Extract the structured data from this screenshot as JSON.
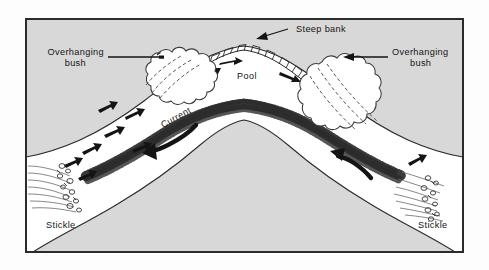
{
  "figure": {
    "frame": {
      "border_color": "#2b2b2b",
      "interior_color": "#d8d8d8",
      "page_color": "#fdfdfd"
    },
    "colors": {
      "land": "#d8d8d8",
      "water": "#ffffff",
      "ink": "#141414",
      "gravel": "#2a2a2a",
      "bush_line": "#3a3a3a"
    },
    "labels": {
      "steep_bank": "Steep bank",
      "overhanging_bush_left": "Overhanging bush",
      "overhanging_bush_left_line1": "Overhanging",
      "overhanging_bush_left_line2": "bush",
      "overhanging_bush_right_line1": "Overhanging",
      "overhanging_bush_right_line2": "bush",
      "pool": "Pool",
      "current": "Current",
      "stickle_left": "Stickle",
      "stickle_right": "Stickle"
    },
    "features": [
      {
        "name": "steep-bank",
        "label": "Steep bank",
        "description": "hatched cut bank along outer bend"
      },
      {
        "name": "pool",
        "label": "Pool",
        "description": "deep water on outer bend"
      },
      {
        "name": "gravel-bar",
        "label": "",
        "description": "stippled point bar on inner bend"
      },
      {
        "name": "current",
        "label": "Current",
        "description": "flow direction arrow"
      },
      {
        "name": "stickle-left",
        "label": "Stickle",
        "description": "shallow riffle, left channel"
      },
      {
        "name": "stickle-right",
        "label": "Stickle",
        "description": "shallow riffle, right channel"
      },
      {
        "name": "overhanging-bush-left",
        "label": "Overhanging bush",
        "description": "bush over left bank"
      },
      {
        "name": "overhanging-bush-right",
        "label": "Overhanging bush",
        "description": "bush over right bank"
      }
    ]
  }
}
